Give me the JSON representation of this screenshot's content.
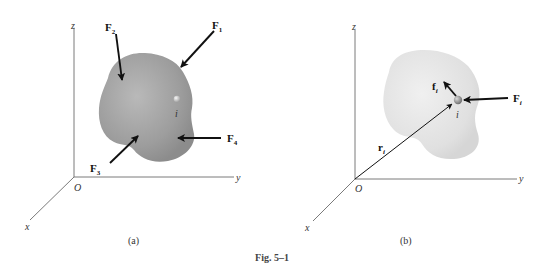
{
  "figure": {
    "caption": "Fig. 5–1",
    "panels": [
      {
        "id": "a",
        "label": "(a)",
        "axes": {
          "z": "z",
          "y": "y",
          "x": "x",
          "origin": "O"
        },
        "point_label": "i",
        "forces": [
          {
            "name": "F",
            "sub": "1"
          },
          {
            "name": "F",
            "sub": "2"
          },
          {
            "name": "F",
            "sub": "3"
          },
          {
            "name": "F",
            "sub": "4"
          }
        ]
      },
      {
        "id": "b",
        "label": "(b)",
        "axes": {
          "z": "z",
          "y": "y",
          "x": "x",
          "origin": "O"
        },
        "point_label": "i",
        "external_force": {
          "name": "F",
          "sub": "i"
        },
        "internal_force": {
          "name": "f",
          "sub": "i"
        },
        "position_vector": {
          "name": "r",
          "sub": "i"
        }
      }
    ]
  },
  "colors": {
    "body_a": "#9a9a9a",
    "body_b": "#dedede",
    "axis": "#6b6b6b",
    "arrow": "#111111"
  }
}
